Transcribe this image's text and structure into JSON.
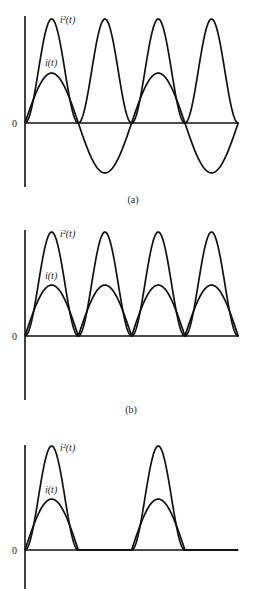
{
  "figure": {
    "panels": [
      {
        "id": "a",
        "caption": "(a)",
        "zero_label": "0",
        "series_labels": {
          "square": "i²(t)",
          "current": "i(t)"
        },
        "waveform": "sine",
        "description": "Full sinusoidal current i(t) and its square i²(t)"
      },
      {
        "id": "b",
        "caption": "(b)",
        "zero_label": "0",
        "series_labels": {
          "square": "i²(t)",
          "current": "i(t)"
        },
        "waveform": "full-wave rectified sine",
        "description": "Full-wave rectified current i(t) and its square i²(t)"
      },
      {
        "id": "c",
        "caption": "",
        "zero_label": "0",
        "series_labels": {
          "square": "i²(t)",
          "current": "i(t)"
        },
        "waveform": "half-wave rectified sine",
        "description": "Half-wave rectified current i(t) and its square i²(t)"
      }
    ]
  },
  "chart_data": [
    {
      "type": "line",
      "title": "(a)",
      "xlabel": "t",
      "ylabel": "",
      "x_half_periods": [
        0,
        1,
        2,
        3,
        4
      ],
      "series": [
        {
          "name": "i(t)",
          "function": "A·sin(ωt)",
          "relative_amplitude": 0.48,
          "values_at_quarter_periods": [
            0,
            0.48,
            0,
            -0.48,
            0,
            0.48,
            0,
            -0.48,
            0
          ]
        },
        {
          "name": "i²(t)",
          "function": "A²·sin²(ωt)",
          "relative_amplitude": 1.0,
          "values_at_quarter_periods": [
            0,
            1,
            0,
            1,
            0,
            1,
            0,
            1,
            0
          ]
        }
      ],
      "y_zero_label": "0",
      "grid": false
    },
    {
      "type": "line",
      "title": "(b)",
      "xlabel": "t",
      "ylabel": "",
      "x_half_periods": [
        0,
        1,
        2,
        3,
        4
      ],
      "series": [
        {
          "name": "i(t)",
          "function": "|A·sin(ωt)|",
          "relative_amplitude": 0.49,
          "values_at_quarter_periods": [
            0,
            0.49,
            0,
            0.49,
            0,
            0.49,
            0,
            0.49,
            0
          ]
        },
        {
          "name": "i²(t)",
          "function": "A²·sin²(ωt)",
          "relative_amplitude": 1.0,
          "values_at_quarter_periods": [
            0,
            1,
            0,
            1,
            0,
            1,
            0,
            1,
            0
          ]
        }
      ],
      "y_zero_label": "0",
      "grid": false
    },
    {
      "type": "line",
      "title": "",
      "xlabel": "t",
      "ylabel": "",
      "x_half_periods": [
        0,
        1,
        2,
        3,
        4
      ],
      "series": [
        {
          "name": "i(t)",
          "function": "max(A·sin(ωt), 0)",
          "relative_amplitude": 0.49,
          "values_at_quarter_periods": [
            0,
            0.49,
            0,
            0,
            0,
            0.49,
            0,
            0,
            0
          ]
        },
        {
          "name": "i²(t)",
          "function": "max(A·sin(ωt),0)²",
          "relative_amplitude": 1.0,
          "values_at_quarter_periods": [
            0,
            1,
            0,
            0,
            0,
            1,
            0,
            0,
            0
          ]
        }
      ],
      "y_zero_label": "0",
      "grid": false
    }
  ]
}
